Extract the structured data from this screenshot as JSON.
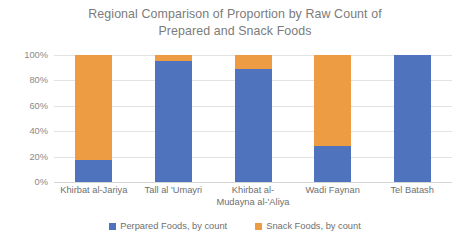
{
  "chart_data": {
    "type": "bar",
    "subtype": "stacked-100-percent",
    "title": "Regional Comparison of Proportion by Raw Count of\nPrepared and Snack Foods",
    "xlabel": "",
    "ylabel": "",
    "ylim": [
      0,
      100
    ],
    "ytick_labels": [
      "0%",
      "20%",
      "40%",
      "60%",
      "80%",
      "100%"
    ],
    "ytick_values": [
      0,
      20,
      40,
      60,
      80,
      100
    ],
    "grid": true,
    "legend_position": "bottom",
    "categories": [
      "Khirbat al-Jariya",
      "Tall al 'Umayri",
      "Khirbat al-\nMudayna al-'Aliya",
      "Wadi Faynan",
      "Tel Batash"
    ],
    "series": [
      {
        "name": "Perpared Foods, by count",
        "color": "#4F74BD",
        "values": [
          17,
          95,
          89,
          28,
          100
        ]
      },
      {
        "name": "Snack Foods, by count",
        "color": "#ED9C44",
        "values": [
          83,
          5,
          11,
          72,
          0
        ]
      }
    ]
  },
  "colors": {
    "prepared": "#4F74BD",
    "snack": "#ED9C44",
    "title_text": "#7b7b7b",
    "axis_text": "#8a8a8a",
    "gridline": "#e2e2e2",
    "background": "#ffffff"
  }
}
